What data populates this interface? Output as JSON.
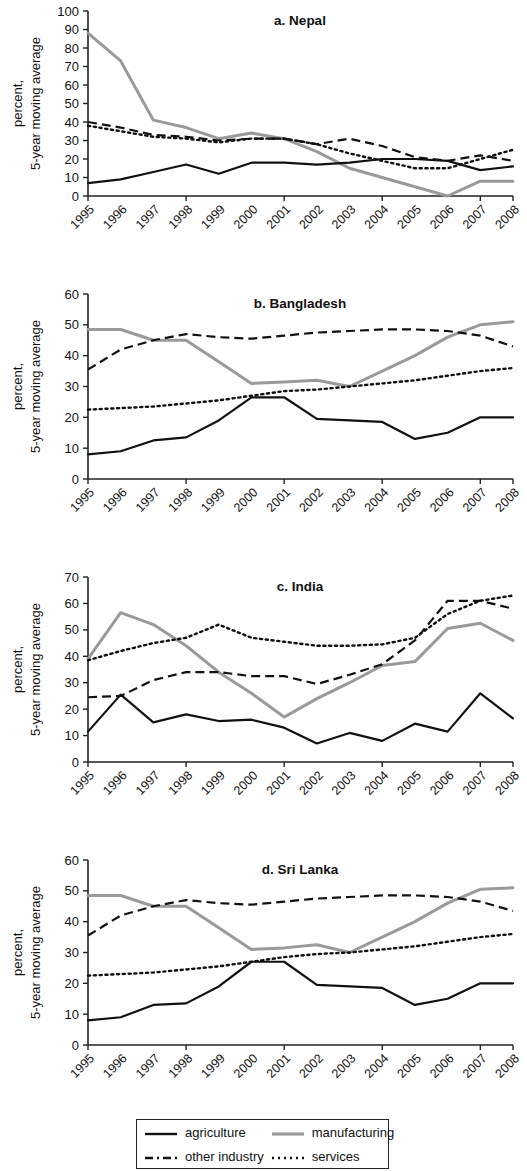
{
  "figure": {
    "y_axis_title_line1": "percent,",
    "y_axis_title_line2": "5-year moving average",
    "x_categories": [
      "1995",
      "1996",
      "1997",
      "1998",
      "1999",
      "2000",
      "2001",
      "2002",
      "2003",
      "2004",
      "2005",
      "2006",
      "2007",
      "2008"
    ]
  },
  "legend": {
    "items": [
      {
        "key": "agriculture",
        "label": "agriculture",
        "style": "solid",
        "color": "#111111"
      },
      {
        "key": "manufacturing",
        "label": "manufacturing",
        "style": "solid",
        "color": "#9a9a9a"
      },
      {
        "key": "other_industry",
        "label": "other industry",
        "style": "dashed",
        "color": "#111111"
      },
      {
        "key": "services",
        "label": "services",
        "style": "dotted",
        "color": "#111111"
      }
    ]
  },
  "chart_data": [
    {
      "id": "nepal",
      "type": "line",
      "title": "a. Nepal",
      "xlabel": "",
      "ylabel": "percent, 5-year moving average",
      "ylim": [
        0,
        100
      ],
      "yticks": [
        0,
        10,
        20,
        30,
        40,
        50,
        60,
        70,
        80,
        90,
        100
      ],
      "grid": false,
      "legend_position": "below-figure",
      "categories": [
        "1995",
        "1996",
        "1997",
        "1998",
        "1999",
        "2000",
        "2001",
        "2002",
        "2003",
        "2004",
        "2005",
        "2006",
        "2007",
        "2008"
      ],
      "series": [
        {
          "name": "agriculture",
          "values": [
            7,
            9,
            13,
            17,
            12,
            18,
            18,
            17,
            18,
            20,
            20,
            19,
            14,
            16
          ]
        },
        {
          "name": "manufacturing",
          "values": [
            88,
            73,
            41,
            37,
            31,
            34,
            31,
            24,
            15,
            10,
            5,
            0,
            8,
            8
          ]
        },
        {
          "name": "other_industry",
          "values": [
            40,
            37,
            33,
            32,
            30,
            31,
            31,
            28,
            31,
            27,
            21,
            19,
            22,
            19
          ]
        },
        {
          "name": "services",
          "values": [
            38,
            35,
            32,
            31,
            29,
            31,
            31,
            28,
            23,
            19,
            15,
            15,
            20,
            25
          ]
        }
      ]
    },
    {
      "id": "bangladesh",
      "type": "line",
      "title": "b. Bangladesh",
      "xlabel": "",
      "ylabel": "percent, 5-year moving average",
      "ylim": [
        0,
        60
      ],
      "yticks": [
        0,
        10,
        20,
        30,
        40,
        50,
        60
      ],
      "grid": false,
      "legend_position": "below-figure",
      "categories": [
        "1995",
        "1996",
        "1997",
        "1998",
        "1999",
        "2000",
        "2001",
        "2002",
        "2003",
        "2004",
        "2005",
        "2006",
        "2007",
        "2008"
      ],
      "series": [
        {
          "name": "agriculture",
          "values": [
            8,
            9,
            12.5,
            13.5,
            19,
            26.5,
            26.5,
            19.5,
            19,
            18.5,
            13,
            15,
            20,
            20
          ]
        },
        {
          "name": "manufacturing",
          "values": [
            48.5,
            48.5,
            45,
            45,
            38,
            31,
            31.5,
            32,
            30,
            35,
            40,
            46,
            50,
            51
          ]
        },
        {
          "name": "other_industry",
          "values": [
            35.5,
            42,
            45,
            47,
            46,
            45.5,
            46.5,
            47.5,
            48,
            48.5,
            48.5,
            48,
            46.5,
            43
          ]
        },
        {
          "name": "services",
          "values": [
            22.5,
            23,
            23.5,
            24.5,
            25.5,
            27,
            28.5,
            29,
            30,
            31,
            32,
            33.5,
            35,
            36
          ]
        }
      ]
    },
    {
      "id": "india",
      "type": "line",
      "title": "c. India",
      "xlabel": "",
      "ylabel": "percent, 5-year moving average",
      "ylim": [
        0,
        70
      ],
      "yticks": [
        0,
        10,
        20,
        30,
        40,
        50,
        60,
        70
      ],
      "grid": false,
      "legend_position": "below-figure",
      "categories": [
        "1995",
        "1996",
        "1997",
        "1998",
        "1999",
        "2000",
        "2001",
        "2002",
        "2003",
        "2004",
        "2005",
        "2006",
        "2007",
        "2008"
      ],
      "series": [
        {
          "name": "agriculture",
          "values": [
            11.5,
            25.5,
            15,
            18,
            15.5,
            16,
            13,
            7,
            11,
            8,
            14.5,
            11.5,
            26,
            16.5
          ]
        },
        {
          "name": "manufacturing",
          "values": [
            39,
            56.5,
            52,
            44,
            34,
            26,
            17,
            24,
            30,
            36.5,
            38,
            50.5,
            52.5,
            46
          ]
        },
        {
          "name": "other_industry",
          "values": [
            24.5,
            25,
            31,
            34,
            34,
            32.5,
            32.5,
            29.5,
            33,
            37,
            46,
            61,
            61,
            58
          ]
        },
        {
          "name": "services",
          "values": [
            38.5,
            42,
            45,
            47,
            52,
            47,
            45.5,
            44,
            44,
            44.5,
            47,
            56,
            61,
            63
          ]
        }
      ]
    },
    {
      "id": "sri_lanka",
      "type": "line",
      "title": "d. Sri Lanka",
      "xlabel": "",
      "ylabel": "percent, 5-year moving average",
      "ylim": [
        0,
        60
      ],
      "yticks": [
        0,
        10,
        20,
        30,
        40,
        50,
        60
      ],
      "grid": false,
      "legend_position": "below-figure",
      "categories": [
        "1995",
        "1996",
        "1997",
        "1998",
        "1999",
        "2000",
        "2001",
        "2002",
        "2003",
        "2004",
        "2005",
        "2006",
        "2007",
        "2008"
      ],
      "series": [
        {
          "name": "agriculture",
          "values": [
            8,
            9,
            13,
            13.5,
            19,
            27,
            27,
            19.5,
            19,
            18.5,
            13,
            15,
            20,
            20
          ]
        },
        {
          "name": "manufacturing",
          "values": [
            48.5,
            48.5,
            45,
            45,
            38,
            31,
            31.5,
            32.5,
            30,
            35,
            40,
            46,
            50.5,
            51
          ]
        },
        {
          "name": "other_industry",
          "values": [
            35.5,
            42,
            45,
            47,
            46,
            45.5,
            46.5,
            47.5,
            48,
            48.5,
            48.5,
            48,
            46.5,
            43.5
          ]
        },
        {
          "name": "services",
          "values": [
            22.5,
            23,
            23.5,
            24.5,
            25.5,
            27,
            28.5,
            29.5,
            30,
            31,
            32,
            33.5,
            35,
            36
          ]
        }
      ]
    }
  ]
}
